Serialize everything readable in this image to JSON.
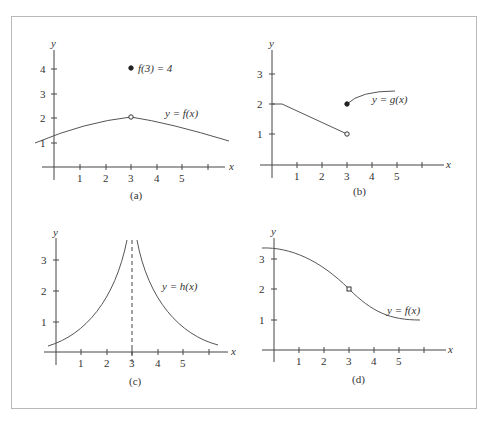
{
  "panels": [
    {
      "id": "a",
      "caption": "(a)",
      "curve_label": "y = f(x)",
      "annotation": "f(3) = 4",
      "x_axis": "x",
      "y_axis": "y",
      "x_ticks": [
        "1",
        "2",
        "3",
        "4",
        "5"
      ],
      "y_ticks": [
        "1",
        "2",
        "3",
        "4"
      ]
    },
    {
      "id": "b",
      "caption": "(b)",
      "curve_label": "y = g(x)",
      "x_axis": "x",
      "y_axis": "y",
      "x_ticks": [
        "1",
        "2",
        "3",
        "4",
        "5"
      ],
      "y_ticks": [
        "1",
        "2",
        "3"
      ]
    },
    {
      "id": "c",
      "caption": "(c)",
      "curve_label": "y = h(x)",
      "x_axis": "x",
      "y_axis": "y",
      "x_ticks": [
        "1",
        "2",
        "3",
        "4",
        "5"
      ],
      "y_ticks": [
        "1",
        "2",
        "3"
      ]
    },
    {
      "id": "d",
      "caption": "(d)",
      "curve_label": "y = f(x)",
      "x_axis": "x",
      "y_axis": "y",
      "x_ticks": [
        "1",
        "2",
        "3",
        "4",
        "5"
      ],
      "y_ticks": [
        "1",
        "2",
        "3"
      ]
    }
  ],
  "colors": {
    "curve": "#555555",
    "axis": "#444444",
    "border": "#b8b8b8",
    "text": "#333333"
  }
}
